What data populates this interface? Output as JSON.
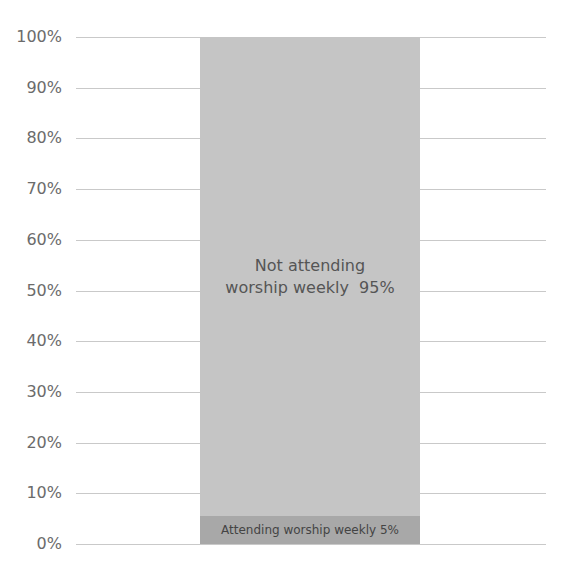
{
  "chart_data": {
    "type": "bar",
    "stacked": true,
    "title": "",
    "xlabel": "",
    "ylabel": "",
    "ylim": [
      0,
      100
    ],
    "y_ticks": [
      "0%",
      "10%",
      "20%",
      "30%",
      "40%",
      "50%",
      "60%",
      "70%",
      "80%",
      "90%",
      "100%"
    ],
    "categories": [
      ""
    ],
    "series": [
      {
        "name": "Attending worship weekly",
        "values": [
          5
        ],
        "label": "Attending worship weekly 5%",
        "color": "#a8a8a8"
      },
      {
        "name": "Not attending worship weekly",
        "values": [
          95
        ],
        "label_line1": "Not attending",
        "label_line2": "worship weekly  95%",
        "color": "#c5c5c5"
      }
    ],
    "grid": true,
    "legend": "none"
  }
}
